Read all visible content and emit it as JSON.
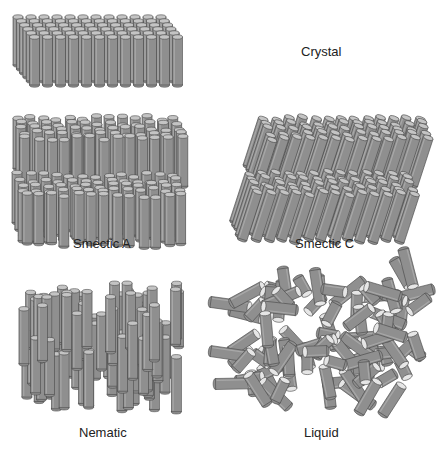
{
  "diagram": {
    "colors": {
      "rod_fill": "#8f8f8f",
      "rod_stroke": "#4a4a4a",
      "rod_cap": "#c4c4c4",
      "liquid_cap": "#e6e6e6",
      "background": "#ffffff"
    },
    "panels": [
      {
        "id": "crystal",
        "label": "Crystal",
        "description": "Perfectly ordered lattice of vertical rods"
      },
      {
        "id": "smectic-a",
        "label": "Smectic A",
        "description": "Two layers of vertical rods"
      },
      {
        "id": "smectic-c",
        "label": "Smectic C",
        "description": "Two layers of tilted rods"
      },
      {
        "id": "nematic",
        "label": "Nematic",
        "description": "Aligned rods with no layering"
      },
      {
        "id": "liquid",
        "label": "Liquid",
        "description": "Randomly oriented rods"
      }
    ]
  }
}
